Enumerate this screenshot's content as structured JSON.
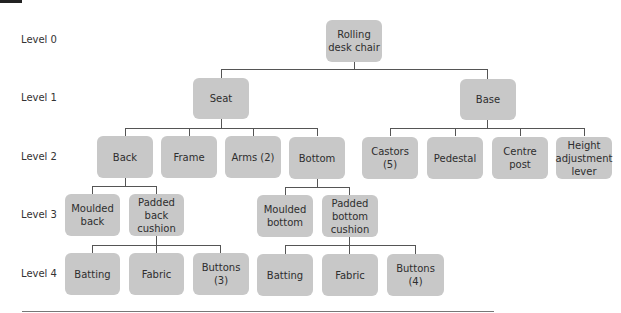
{
  "levels": [
    "Level 0",
    "Level 1",
    "Level 2",
    "Level 3",
    "Level 4"
  ],
  "nodes": {
    "root": "Rolling desk chair",
    "seat": "Seat",
    "base": "Base",
    "back": "Back",
    "frame": "Frame",
    "arms": "Arms (2)",
    "bottom": "Bottom",
    "castors": "Castors (5)",
    "pedestal": "Pedestal",
    "centre_post": "Centre post",
    "height_lever": "Height adjustment lever",
    "moulded_back": "Moulded back",
    "padded_back_cushion": "Padded back cushion",
    "moulded_bottom": "Moulded bottom",
    "padded_bottom_cushion": "Padded bottom cushion",
    "back_batting": "Batting",
    "back_fabric": "Fabric",
    "back_buttons": "Buttons (3)",
    "bottom_batting": "Batting",
    "bottom_fabric": "Fabric",
    "bottom_buttons": "Buttons (4)"
  },
  "colors": {
    "node_fill": "#c8c8c8",
    "connector": "#555555"
  }
}
